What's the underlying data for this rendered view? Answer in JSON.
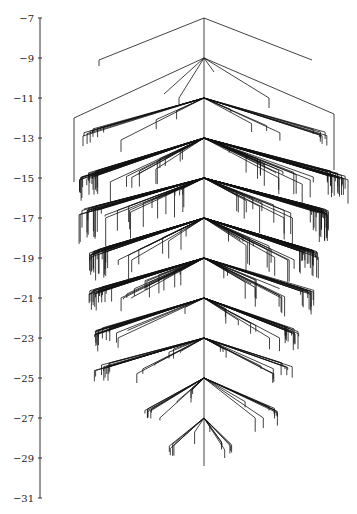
{
  "figure": {
    "type": "tree-diagram",
    "axis": {
      "orientation": "vertical",
      "ticks": [
        -7,
        -9,
        -11,
        -13,
        -15,
        -17,
        -19,
        -21,
        -23,
        -25,
        -27,
        -29,
        -31
      ],
      "tick_labels": [
        "−7",
        "−9",
        "−11",
        "−13",
        "−15",
        "−17",
        "−19",
        "−21",
        "−23",
        "−25",
        "−27",
        "−29",
        "−31"
      ],
      "range": [
        -31,
        -7
      ]
    },
    "trunk": {
      "x_center": 204,
      "top_value": -7,
      "bottom_value": -29.4
    },
    "hubs": [
      {
        "value": -7,
        "fan": [
          {
            "dx": -105,
            "dy": 2.1,
            "drop": 0.3
          },
          {
            "dx": 108,
            "dy": 2.1,
            "drop": 0.0
          }
        ]
      },
      {
        "value": -9,
        "fan": [
          {
            "dx": -130,
            "dy": 3.0,
            "drop": 3.2
          },
          {
            "dx": -40,
            "dy": 1.8,
            "drop": 0.0
          },
          {
            "dx": -25,
            "dy": 2.0,
            "drop": 0.3
          },
          {
            "dx": 10,
            "dy": 0.7,
            "drop": 0
          },
          {
            "dx": 65,
            "dy": 2.0,
            "drop": 0.5
          },
          {
            "dx": 130,
            "dy": 2.8,
            "drop": 2.8
          }
        ],
        "count": 6
      },
      {
        "value": -11,
        "count": 22,
        "spread_left": 125,
        "spread_right": 125,
        "depth": 2.0,
        "drop": 0.6
      },
      {
        "value": -13,
        "count": 70,
        "spread_left": 125,
        "spread_right": 145,
        "depth": 2.2,
        "drop": 1.2
      },
      {
        "value": -15,
        "count": 75,
        "spread_left": 125,
        "spread_right": 125,
        "depth": 1.9,
        "drop": 1.5
      },
      {
        "value": -17,
        "count": 70,
        "spread_left": 115,
        "spread_right": 115,
        "depth": 2.0,
        "drop": 1.4
      },
      {
        "value": -19,
        "count": 60,
        "spread_left": 115,
        "spread_right": 110,
        "depth": 1.9,
        "drop": 1.0
      },
      {
        "value": -21,
        "count": 40,
        "spread_left": 110,
        "spread_right": 95,
        "depth": 1.9,
        "drop": 0.9
      },
      {
        "value": -23,
        "count": 30,
        "spread_left": 110,
        "spread_right": 90,
        "depth": 1.7,
        "drop": 0.7
      },
      {
        "value": -25,
        "count": 20,
        "spread_left": 60,
        "spread_right": 75,
        "depth": 1.9,
        "drop": 0.8
      },
      {
        "value": -27,
        "count": 12,
        "spread_left": 35,
        "spread_right": 30,
        "depth": 1.6,
        "drop": 0.6
      }
    ],
    "colors": {
      "edges": "#111111",
      "axis": "#333333",
      "background": "#ffffff"
    }
  }
}
